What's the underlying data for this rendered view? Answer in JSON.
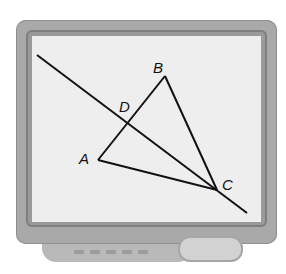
{
  "diagram": {
    "type": "geometry",
    "device": "monitor-frame",
    "points": {
      "A": {
        "label": "A",
        "x": 98,
        "y": 160
      },
      "B": {
        "label": "B",
        "x": 165,
        "y": 76
      },
      "C": {
        "label": "C",
        "x": 217,
        "y": 190
      },
      "D": {
        "label": "D",
        "x": 128,
        "y": 123
      }
    },
    "segments": [
      "AB",
      "BC",
      "AC"
    ],
    "line_through": [
      "D",
      "C"
    ],
    "line_color": "#111111"
  }
}
